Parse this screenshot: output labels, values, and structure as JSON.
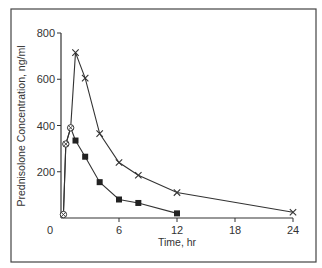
{
  "chart_data": {
    "type": "line",
    "title": "",
    "xlabel": "Time, hr",
    "ylabel": "Prednisolone Concentration, ng/ml",
    "xlim": [
      0,
      24
    ],
    "ylim": [
      0,
      800
    ],
    "xticks": [
      0,
      6,
      12,
      18,
      24
    ],
    "yticks": [
      200,
      400,
      600,
      800
    ],
    "xtick_labels": [
      "0",
      "6",
      "12",
      "18",
      "24"
    ],
    "ytick_labels": [
      "200",
      "400",
      "600",
      "800"
    ],
    "grid": false,
    "legend": null,
    "series": [
      {
        "name": "Series A (cross markers)",
        "marker": "x",
        "x": [
          0.25,
          0.5,
          1,
          1.5,
          2.5,
          4,
          6,
          8,
          12,
          24
        ],
        "y": [
          15,
          320,
          390,
          715,
          605,
          365,
          240,
          185,
          110,
          25
        ]
      },
      {
        "name": "Series B (square markers)",
        "marker": "square",
        "x": [
          0.25,
          0.5,
          1,
          1.5,
          2.5,
          4,
          6,
          8,
          12
        ],
        "y": [
          15,
          320,
          390,
          335,
          265,
          155,
          80,
          65,
          20
        ]
      }
    ],
    "shared_markers": {
      "marker": "circle-x",
      "x": [
        0.25,
        0.5,
        1
      ],
      "y": [
        15,
        320,
        390
      ]
    }
  },
  "colors": {
    "line": "#333333",
    "frame": "#444444",
    "background": "#ffffff"
  }
}
